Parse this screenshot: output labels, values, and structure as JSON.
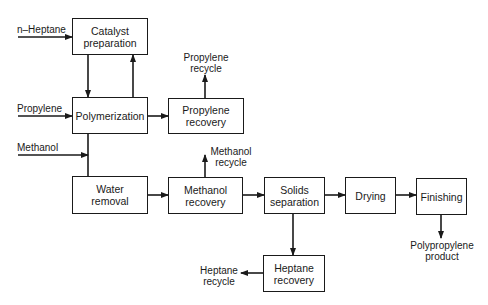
{
  "diagram": {
    "type": "process-flow",
    "boxes": {
      "catalyst": "Catalyst\npreparation",
      "polymerization": "Polymerization",
      "propylene_recovery": "Propylene\nrecovery",
      "water_removal": "Water\nremoval",
      "methanol_recovery": "Methanol\nrecovery",
      "solids_separation": "Solids\nseparation",
      "drying": "Drying",
      "finishing": "Finishing",
      "heptane_recovery": "Heptane\nrecovery"
    },
    "inputs": {
      "heptane": "n–Heptane",
      "propylene": "Propylene",
      "methanol": "Methanol"
    },
    "outputs": {
      "propylene_recycle": "Propylene\nrecycle",
      "methanol_recycle": "Methanol\nrecycle",
      "heptane_recycle": "Heptane\nrecycle",
      "product": "Polypropylene\nproduct"
    },
    "colors": {
      "line": "#1a1a1a",
      "background": "#ffffff"
    }
  }
}
